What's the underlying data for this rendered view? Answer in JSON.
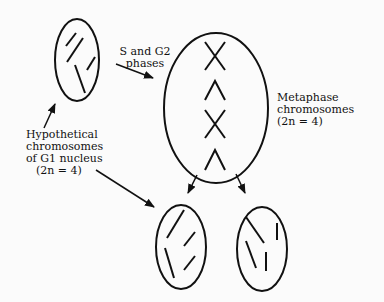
{
  "diagram": {
    "labels": {
      "phases": {
        "line1": "S and G2",
        "line2": "phases"
      },
      "metaphase": {
        "line1": "Metaphase",
        "line2": "chromosomes",
        "line3": "(2n = 4)"
      },
      "g1": {
        "line1": "Hypothetical",
        "line2": "chromosomes",
        "line3": "of G1 nucleus",
        "line4": "(2n = 4)"
      }
    },
    "nodes": [
      {
        "id": "g1-nucleus",
        "shape": "ellipse",
        "chromosomes": 4,
        "style": "single-chromatid lines"
      },
      {
        "id": "metaphase-cell",
        "shape": "ellipse",
        "chromosomes": 4,
        "style": "X and inverted-V shapes"
      },
      {
        "id": "daughter-cell-left",
        "shape": "ellipse",
        "chromosomes": 4
      },
      {
        "id": "daughter-cell-right",
        "shape": "ellipse",
        "chromosomes": 4
      }
    ],
    "edges": [
      {
        "from": "g1-nucleus",
        "to": "metaphase-cell",
        "label": "S and G2 phases"
      },
      {
        "from": "metaphase-cell",
        "to": "daughter-cell-left"
      },
      {
        "from": "metaphase-cell",
        "to": "daughter-cell-right"
      }
    ],
    "colors": {
      "stroke": "#111111",
      "background": "#fbfbfb"
    }
  }
}
